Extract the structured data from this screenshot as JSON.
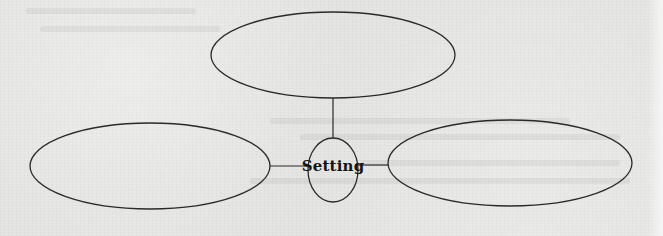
{
  "diagram": {
    "type": "graphic-organizer",
    "center": {
      "label": "Setting",
      "cx": 333,
      "cy": 170,
      "rx": 25,
      "ry": 32
    },
    "nodes": [
      {
        "id": "top",
        "label": "",
        "cx": 333,
        "cy": 55,
        "rx": 122,
        "ry": 43
      },
      {
        "id": "left",
        "label": "",
        "cx": 150,
        "cy": 166,
        "rx": 120,
        "ry": 43
      },
      {
        "id": "right",
        "label": "",
        "cx": 510,
        "cy": 163,
        "rx": 122,
        "ry": 43
      }
    ],
    "connectors": [
      {
        "from": "center",
        "to": "top"
      },
      {
        "from": "center",
        "to": "left"
      },
      {
        "from": "center",
        "to": "right"
      }
    ],
    "colors": {
      "stroke": "#2a2a2a",
      "background": "#e4e4e2",
      "text": "#151515"
    }
  }
}
